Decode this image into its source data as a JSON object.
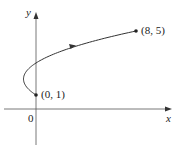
{
  "chart_data": {
    "type": "line",
    "title": "",
    "xlabel": "x",
    "ylabel": "y",
    "origin_label": "0",
    "parametric": {
      "x": "t^2 - 2t",
      "y": "t + 1",
      "t_range": [
        0,
        4
      ]
    },
    "series": [
      {
        "name": "curve",
        "x": [
          0,
          -0.75,
          -1,
          -0.75,
          0,
          1.25,
          3,
          5.25,
          8
        ],
        "y": [
          1,
          1.5,
          2,
          2.5,
          3,
          3.5,
          4,
          4.5,
          5
        ]
      }
    ],
    "points": [
      {
        "label": "(0, 1)",
        "x": 0,
        "y": 1
      },
      {
        "label": "(8, 5)",
        "x": 8,
        "y": 5
      }
    ],
    "direction_arrow": "increasing t",
    "grid": false
  }
}
